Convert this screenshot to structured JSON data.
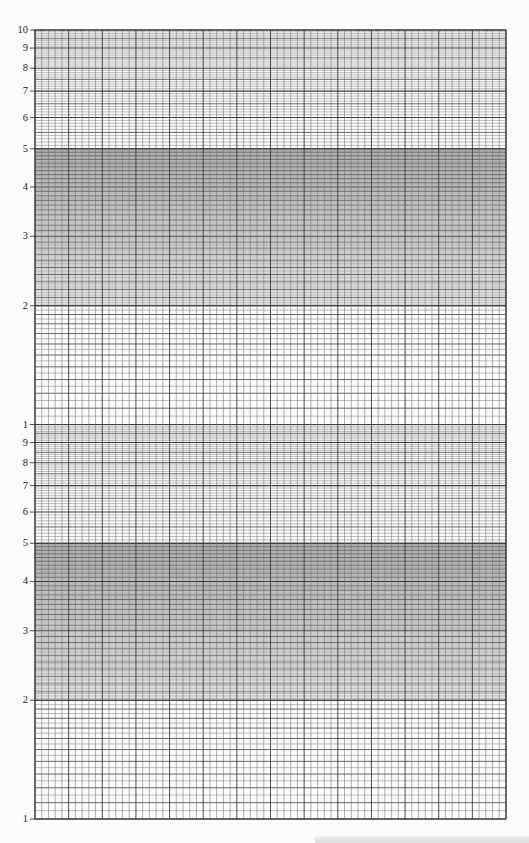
{
  "chart_data": {
    "type": "semilog-graph-paper",
    "title": "",
    "xlabel": "",
    "ylabel": "",
    "y_scale": "log",
    "decades": 2,
    "y_tick_labels_top_decade": [
      "10",
      "9",
      "8",
      "7",
      "6",
      "5",
      "4",
      "3",
      "2"
    ],
    "y_tick_labels_bottom_decade": [
      "1",
      "9",
      "8",
      "7",
      "6",
      "5",
      "4",
      "3",
      "2",
      "1"
    ],
    "y_ticks": [
      {
        "label": "10",
        "value": 10,
        "decade": "top"
      },
      {
        "label": "9",
        "value": 9,
        "decade": "top"
      },
      {
        "label": "8",
        "value": 8,
        "decade": "top"
      },
      {
        "label": "7",
        "value": 7,
        "decade": "top"
      },
      {
        "label": "6",
        "value": 6,
        "decade": "top"
      },
      {
        "label": "5",
        "value": 5,
        "decade": "top"
      },
      {
        "label": "4",
        "value": 4,
        "decade": "top"
      },
      {
        "label": "3",
        "value": 3,
        "decade": "top"
      },
      {
        "label": "2",
        "value": 2,
        "decade": "top"
      },
      {
        "label": "1",
        "value": 10,
        "decade": "bottom"
      },
      {
        "label": "9",
        "value": 9,
        "decade": "bottom"
      },
      {
        "label": "8",
        "value": 8,
        "decade": "bottom"
      },
      {
        "label": "7",
        "value": 7,
        "decade": "bottom"
      },
      {
        "label": "6",
        "value": 6,
        "decade": "bottom"
      },
      {
        "label": "5",
        "value": 5,
        "decade": "bottom"
      },
      {
        "label": "4",
        "value": 4,
        "decade": "bottom"
      },
      {
        "label": "3",
        "value": 3,
        "decade": "bottom"
      },
      {
        "label": "2",
        "value": 2,
        "decade": "bottom"
      },
      {
        "label": "1",
        "value": 1,
        "decade": "bottom"
      }
    ],
    "minor_subdivisions": [
      {
        "from": 1,
        "to": 2,
        "step": 0.05,
        "major_every": 0.1
      },
      {
        "from": 2,
        "to": 5,
        "step": 0.02,
        "major_every": 0.1
      },
      {
        "from": 5,
        "to": 10,
        "step": 0.1,
        "major_every": 0.5
      }
    ],
    "x_scale": "linear",
    "x_columns": 70,
    "x_major_every": 5,
    "grid": true,
    "legend": null,
    "series": []
  },
  "layout": {
    "grid_left": 35,
    "grid_right": 506,
    "grid_top": 30,
    "decade_height": 394.5,
    "line_color": "#3a3a3a",
    "minor_line_color": "#6e6e6e"
  }
}
